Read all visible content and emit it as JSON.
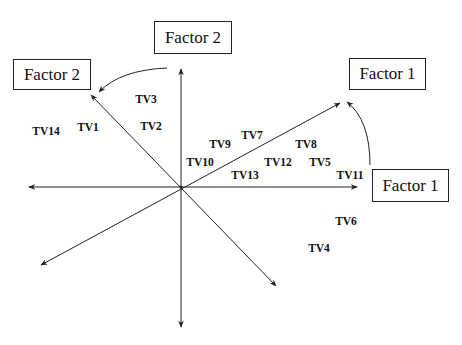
{
  "diagram": {
    "colors": {
      "line": "#222222",
      "text": "#111111",
      "background": "#ffffff"
    },
    "boxes": {
      "factor2_original": "Factor 2",
      "factor2_rotated": "Factor 2",
      "factor1_rotated": "Factor 1",
      "factor1_original": "Factor 1"
    },
    "variables": [
      {
        "label": "TV3",
        "x": 146,
        "y": 99
      },
      {
        "label": "TV14",
        "x": 46,
        "y": 131
      },
      {
        "label": "TV1",
        "x": 88,
        "y": 127
      },
      {
        "label": "TV2",
        "x": 151,
        "y": 126
      },
      {
        "label": "TV9",
        "x": 220,
        "y": 144
      },
      {
        "label": "TV7",
        "x": 252,
        "y": 135
      },
      {
        "label": "TV8",
        "x": 306,
        "y": 144
      },
      {
        "label": "TV10",
        "x": 200,
        "y": 162
      },
      {
        "label": "TV12",
        "x": 278,
        "y": 162
      },
      {
        "label": "TV5",
        "x": 320,
        "y": 162
      },
      {
        "label": "TV13",
        "x": 245,
        "y": 175
      },
      {
        "label": "TV11",
        "x": 350,
        "y": 175
      },
      {
        "label": "TV6",
        "x": 346,
        "y": 221
      },
      {
        "label": "TV4",
        "x": 319,
        "y": 248
      }
    ]
  }
}
